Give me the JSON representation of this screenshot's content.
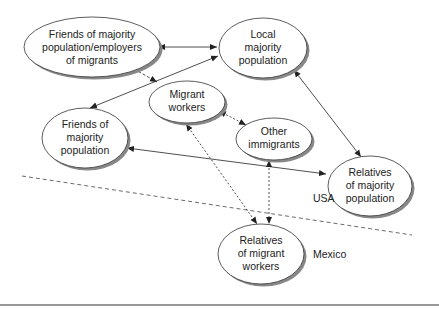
{
  "diagram": {
    "nodes": [
      {
        "id": "friends_employers",
        "lines": [
          "Friends of majority",
          "population/employers",
          "of migrants"
        ]
      },
      {
        "id": "local_majority",
        "lines": [
          "Local",
          "majority",
          "population"
        ]
      },
      {
        "id": "migrant_workers",
        "lines": [
          "Migrant",
          "workers"
        ]
      },
      {
        "id": "friends_majority",
        "lines": [
          "Friends of",
          "majority",
          "population"
        ]
      },
      {
        "id": "other_immigrants",
        "lines": [
          "Other",
          "immigrants"
        ]
      },
      {
        "id": "relatives_majority",
        "lines": [
          "Relatives",
          "of majority",
          "population"
        ]
      },
      {
        "id": "relatives_migrant",
        "lines": [
          "Relatives",
          "of migrant",
          "workers"
        ]
      }
    ],
    "edges": [
      {
        "from": "friends_employers",
        "to": "local_majority",
        "style": "solid",
        "direction": "both"
      },
      {
        "from": "friends_majority",
        "to": "local_majority",
        "style": "solid",
        "direction": "both"
      },
      {
        "from": "friends_employers",
        "to": "migrant_workers",
        "style": "dashed",
        "direction": "to"
      },
      {
        "from": "local_majority",
        "to": "relatives_majority",
        "style": "solid",
        "direction": "both"
      },
      {
        "from": "friends_majority",
        "to": "relatives_majority",
        "style": "solid",
        "direction": "both"
      },
      {
        "from": "migrant_workers",
        "to": "other_immigrants",
        "style": "dotted",
        "direction": "both"
      },
      {
        "from": "migrant_workers",
        "to": "relatives_migrant",
        "style": "dotted",
        "direction": "both"
      },
      {
        "from": "other_immigrants",
        "to": "relatives_migrant",
        "style": "dotted",
        "direction": "both"
      }
    ],
    "regions": {
      "usa": "USA",
      "mexico": "Mexico"
    }
  }
}
